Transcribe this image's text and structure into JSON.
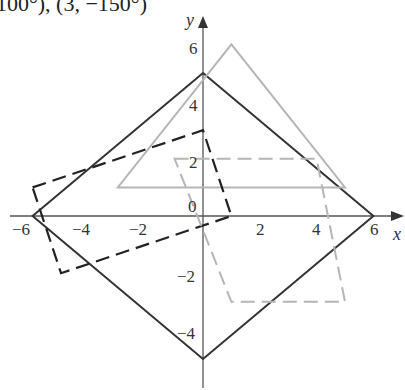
{
  "header_fragment": "100°), (3, −150°)",
  "axes": {
    "x_label": "x",
    "y_label": "y",
    "x_ticks": [
      "−6",
      "−4",
      "−2",
      "2",
      "4",
      "6"
    ],
    "y_ticks": [
      "6",
      "4",
      "2",
      "−2",
      "−4"
    ],
    "origin_label": "0"
  },
  "shapes": [
    {
      "name": "black-solid-rhombus",
      "style": "solid",
      "color": "#333333",
      "points": [
        [
          0,
          5
        ],
        [
          6,
          0
        ],
        [
          0,
          -5
        ],
        [
          -6,
          0
        ]
      ]
    },
    {
      "name": "gray-solid-triangle",
      "style": "solid",
      "color": "#aaaaaa",
      "points": [
        [
          1,
          6
        ],
        [
          5,
          1
        ],
        [
          -3,
          1
        ]
      ]
    },
    {
      "name": "black-dashed-quadrilateral",
      "style": "dashed",
      "color": "#222222",
      "points": [
        [
          -6,
          1
        ],
        [
          0,
          3
        ],
        [
          1,
          0
        ],
        [
          -5,
          -2
        ]
      ]
    },
    {
      "name": "gray-dashed-parallelogram",
      "style": "dashed",
      "color": "#aaaaaa",
      "points": [
        [
          -1,
          2
        ],
        [
          4,
          2
        ],
        [
          5,
          -3
        ],
        [
          1,
          -3
        ]
      ]
    }
  ]
}
